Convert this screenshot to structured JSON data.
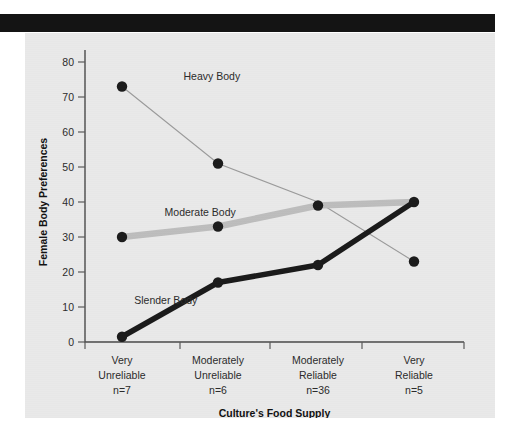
{
  "figure": {
    "background_color": "#e9e9e9",
    "page_color": "#ffffff",
    "header_bar_color": "#141414"
  },
  "chart_data": {
    "type": "line",
    "title": "",
    "xlabel": "Culture's Food Supply",
    "ylabel": "Female Body Preferences",
    "ylim": [
      0,
      80
    ],
    "yticks": [
      0,
      10,
      20,
      30,
      40,
      50,
      60,
      70,
      80
    ],
    "grid": false,
    "legend_position": "inline-annotations",
    "categories": [
      "Very\nUnreliable\nn=7",
      "Moderately\nUnreliable\nn=6",
      "Moderately\nReliable\nn=36",
      "Very\nReliable\nn=5"
    ],
    "category_lines": [
      [
        "Very",
        "Unreliable",
        "n=7"
      ],
      [
        "Moderately",
        "Unreliable",
        "n=6"
      ],
      [
        "Moderately",
        "Reliable",
        "n=36"
      ],
      [
        "Very",
        "Reliable",
        "n=5"
      ]
    ],
    "sample_sizes": [
      "n=7",
      "n=6",
      "n=36",
      "n=5"
    ],
    "series": [
      {
        "name": "Heavy Body",
        "values": [
          73,
          51,
          40,
          23
        ],
        "color": "#9a9a9a",
        "line_width": 1.1,
        "style": "thin-gray",
        "markers": [
          true,
          true,
          false,
          true
        ],
        "label_x_pct": 26,
        "label_y_value": 75
      },
      {
        "name": "Moderate Body",
        "values": [
          30,
          33,
          39,
          40
        ],
        "color": "#bdbdbd",
        "line_width": 6.5,
        "style": "thick-light-gray",
        "markers": [
          true,
          true,
          true,
          false
        ],
        "label_x_pct": 21,
        "label_y_value": 36
      },
      {
        "name": "Slender Body",
        "values": [
          1.5,
          17,
          22,
          40
        ],
        "color": "#1a1a1a",
        "line_width": 5.5,
        "style": "thick-black",
        "markers": [
          true,
          true,
          true,
          true
        ],
        "label_x_pct": 13,
        "label_y_value": 11
      }
    ]
  }
}
